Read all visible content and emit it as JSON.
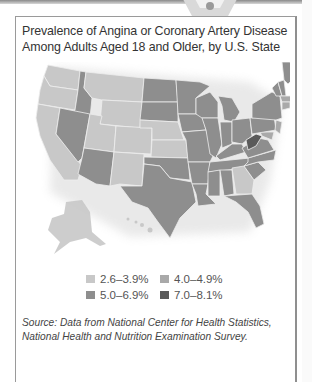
{
  "figure": {
    "title": "Prevalence of Angina or Coronary Artery Disease Among Adults Aged 18 and Older, by U.S. State",
    "source": "Source: Data from National Center for Health Statistics, National Health and Nutrition Examination Survey."
  },
  "legend": {
    "items": [
      {
        "label": "2.6–3.9%",
        "color": "#c8c8c8"
      },
      {
        "label": "4.0–4.9%",
        "color": "#a9a9a9"
      },
      {
        "label": "5.0–6.9%",
        "color": "#8e8e8e"
      },
      {
        "label": "7.0–8.1%",
        "color": "#5a5a5a"
      }
    ]
  },
  "map_data": {
    "type": "choropleth",
    "region": "United States",
    "categories": [
      "2.6–3.9%",
      "4.0–4.9%",
      "5.0–6.9%",
      "7.0–8.1%"
    ],
    "state_class": {
      "WA": "2.6–3.9%",
      "OR": "2.6–3.9%",
      "CA": "2.6–3.9%",
      "MT": "2.6–3.9%",
      "WY": "2.6–3.9%",
      "UT": "2.6–3.9%",
      "CO": "2.6–3.9%",
      "NM": "2.6–3.9%",
      "NE": "2.6–3.9%",
      "GA": "2.6–3.9%",
      "AK": "2.6–3.9%",
      "HI": "2.6–3.9%",
      "ID": "5.0–6.9%",
      "NV": "5.0–6.9%",
      "AZ": "5.0–6.9%",
      "ND": "5.0–6.9%",
      "SD": "5.0–6.9%",
      "KS": "5.0–6.9%",
      "OK": "5.0–6.9%",
      "TX": "5.0–6.9%",
      "MN": "5.0–6.9%",
      "IA": "5.0–6.9%",
      "MO": "5.0–6.9%",
      "AR": "5.0–6.9%",
      "LA": "5.0–6.9%",
      "WI": "5.0–6.9%",
      "IL": "5.0–6.9%",
      "MI": "5.0–6.9%",
      "IN": "5.0–6.9%",
      "OH": "5.0–6.9%",
      "KY": "5.0–6.9%",
      "TN": "5.0–6.9%",
      "MS": "5.0–6.9%",
      "AL": "5.0–6.9%",
      "FL": "5.0–6.9%",
      "SC": "5.0–6.9%",
      "NC": "5.0–6.9%",
      "VA": "5.0–6.9%",
      "PA": "5.0–6.9%",
      "NY": "5.0–6.9%",
      "ME": "5.0–6.9%",
      "VT": "5.0–6.9%",
      "NH": "5.0–6.9%",
      "MA": "4.0–4.9%",
      "CT": "4.0–4.9%",
      "RI": "4.0–4.9%",
      "NJ": "4.0–4.9%",
      "DE": "4.0–4.9%",
      "MD": "4.0–4.9%",
      "WV": "7.0–8.1%"
    }
  }
}
